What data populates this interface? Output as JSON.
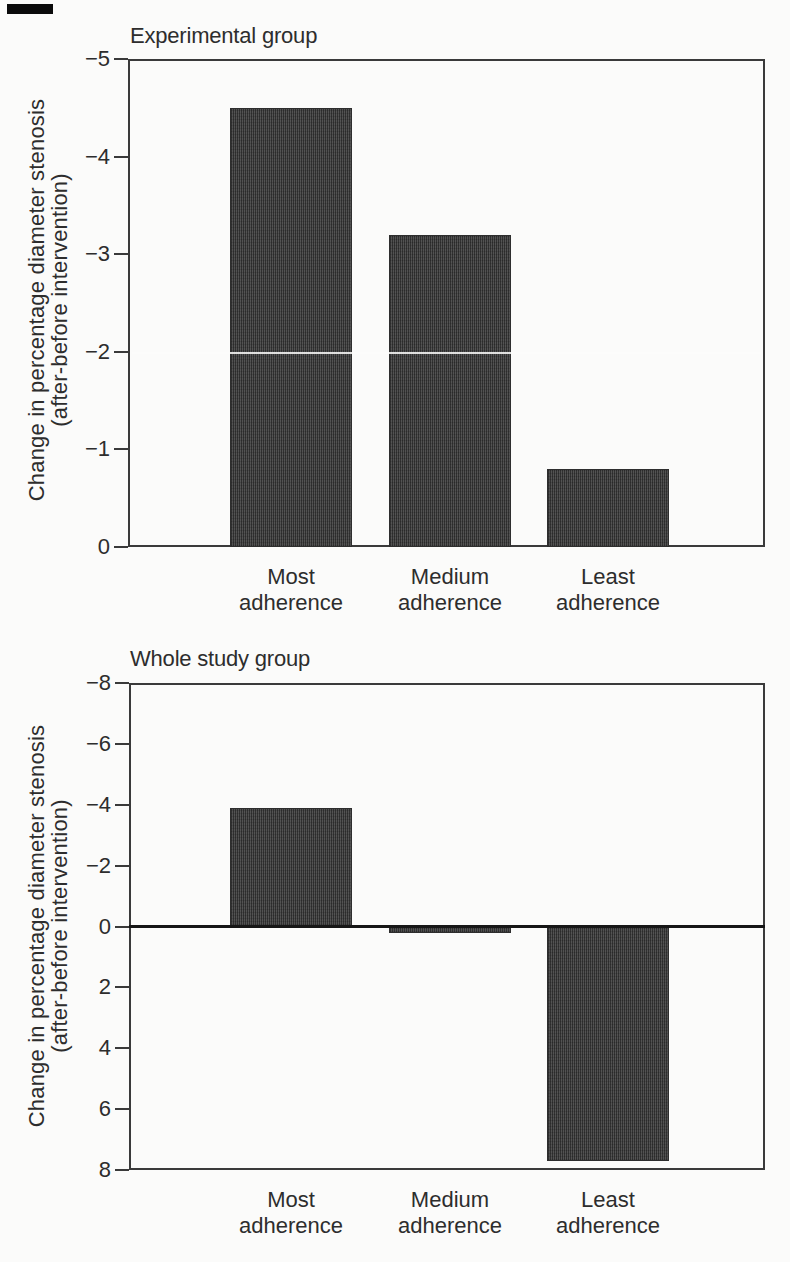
{
  "figure": {
    "colors": {
      "bar_fill": "#4a4a4a",
      "axis": "#3a3a3a",
      "text": "#2d2d2d",
      "zero_baseline": "#161616",
      "background": "#fbfbfa"
    }
  },
  "chart_data": [
    {
      "type": "bar",
      "title": "Experimental group",
      "categories": [
        "Most adherence",
        "Medium adherence",
        "Least adherence"
      ],
      "values": [
        -4.5,
        -3.2,
        -0.8
      ],
      "xlabel": "",
      "ylabel": "Change in percentage diameter stenosis (after-before intervention)",
      "ylabel_lines": [
        "Change in percentage diameter stenosis",
        "(after-before intervention)"
      ],
      "yticks": [
        -5,
        -4,
        -3,
        -2,
        -1,
        0
      ],
      "ytick_labels": [
        "−5",
        "−4",
        "−3",
        "−2",
        "−1",
        "0"
      ],
      "ylim_top": -5,
      "ylim_bottom": 0,
      "axis_orientation": "negative values upward, zero at baseline",
      "grid": false,
      "legend": null,
      "zero_line": false
    },
    {
      "type": "bar",
      "title": "Whole study group",
      "categories": [
        "Most adherence",
        "Medium adherence",
        "Least adherence"
      ],
      "values": [
        -3.9,
        0.2,
        7.7
      ],
      "xlabel": "",
      "ylabel": "Change in percentage diameter stenosis (after-before intervention)",
      "ylabel_lines": [
        "Change in percentage diameter stenosis",
        "(after-before intervention)"
      ],
      "yticks": [
        -8,
        -6,
        -4,
        -2,
        0,
        2,
        4,
        6,
        8
      ],
      "ytick_labels": [
        "−8",
        "−6",
        "−4",
        "−2",
        "0",
        "2",
        "4",
        "6",
        "8"
      ],
      "ylim_top": -8,
      "ylim_bottom": 8,
      "axis_orientation": "negative values upward, positive values downward",
      "grid": false,
      "legend": null,
      "zero_line": true
    }
  ]
}
